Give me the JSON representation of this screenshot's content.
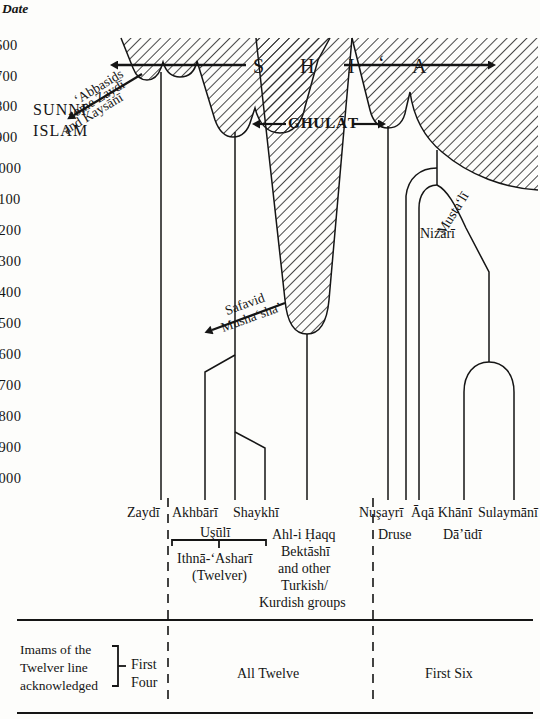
{
  "figure": {
    "type": "genealogical-timeline-diagram",
    "axis_title": "Date"
  },
  "date_axis": {
    "title": "Date",
    "unit": "CE",
    "ticks": [
      {
        "label": "600",
        "y": 45
      },
      {
        "label": "700",
        "y": 76
      },
      {
        "label": "800",
        "y": 106
      },
      {
        "label": "900",
        "y": 137
      },
      {
        "label": "1000",
        "y": 168
      },
      {
        "label": "1100",
        "y": 199
      },
      {
        "label": "1200",
        "y": 230
      },
      {
        "label": "1300",
        "y": 261
      },
      {
        "label": "1400",
        "y": 292
      },
      {
        "label": "1500",
        "y": 323
      },
      {
        "label": "1600",
        "y": 354
      },
      {
        "label": "1700",
        "y": 385
      },
      {
        "label": "1800",
        "y": 416
      },
      {
        "label": "1900",
        "y": 447
      },
      {
        "label": "2000",
        "y": 478
      }
    ]
  },
  "regions": {
    "sunni": {
      "label_line1": "SUNNI",
      "label_line2": "ISLAM"
    },
    "shia": {
      "letters": [
        "S",
        "H",
        "I",
        "‘",
        "A"
      ],
      "label": "SHI‘A"
    },
    "ghulat": {
      "label": "GHULĀT"
    }
  },
  "arrows": {
    "abbasids": {
      "line1": "‘Abbasids",
      "line2": "some Zaydī",
      "line3": "and Kaysānī"
    },
    "safavid": {
      "above": "Safavid",
      "below": "Musha‘sha’"
    }
  },
  "branch_labels": {
    "nizari": "Nizārī",
    "mustali": "Musta‘lī"
  },
  "sects": [
    {
      "name": "Zaydī",
      "x": 155,
      "y": 512
    },
    {
      "name": "Akhbārī",
      "x": 195,
      "y": 512
    },
    {
      "name": "Shaykhī",
      "x": 255,
      "y": 512
    },
    {
      "name": "Nuşayrī",
      "x": 385,
      "y": 512
    },
    {
      "name": "Āqā Khānī",
      "x": 440,
      "y": 512
    },
    {
      "name": "Sulaymānī",
      "x": 500,
      "y": 512
    }
  ],
  "sub_labels": [
    {
      "name": "Uşūlī",
      "x": 219,
      "y": 535
    },
    {
      "name": "Ithnā-‘Asharī",
      "x": 219,
      "y": 560
    },
    {
      "name": "(Twelver)",
      "x": 219,
      "y": 577
    },
    {
      "name": "Druse",
      "x": 394,
      "y": 535
    },
    {
      "name": "Dā’ūdī",
      "x": 466,
      "y": 535
    }
  ],
  "ahl_i_haqq": {
    "lines": [
      "Ahl-i Ḥaqq",
      "Bektāshī",
      "and other",
      "Turkish/",
      "Kurdish groups"
    ]
  },
  "legend": {
    "caption_lines": [
      "Imams of the",
      "Twelver line",
      "acknowledged"
    ],
    "cells": [
      {
        "label_line1": "First",
        "label_line2": "Four",
        "x": 146
      },
      {
        "label_line1": "All Twelve",
        "label_line2": "",
        "x": 270
      },
      {
        "label_line1": "First Six",
        "label_line2": "",
        "x": 455
      }
    ]
  },
  "colors": {
    "ink": "#151515",
    "hatch": "#2b2b2b",
    "paper": "#fdfdfb"
  }
}
